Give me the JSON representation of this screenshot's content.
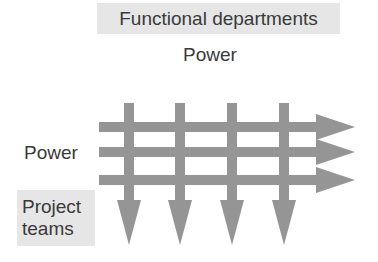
{
  "diagram": {
    "top_label": "Functional departments",
    "top_power_label": "Power",
    "left_power_label": "Power",
    "bottom_left_label": "Project\nteams",
    "arrow_color": "#959595",
    "label_box_color": "#e6e6e6",
    "vertical_arrows": [
      {
        "name": "department-1",
        "x": 129
      },
      {
        "name": "department-2",
        "x": 180
      },
      {
        "name": "department-3",
        "x": 232
      },
      {
        "name": "department-4",
        "x": 284
      }
    ],
    "horizontal_arrows": [
      {
        "name": "project-1",
        "y": 127
      },
      {
        "name": "project-2",
        "y": 152
      },
      {
        "name": "project-3",
        "y": 180
      }
    ]
  }
}
